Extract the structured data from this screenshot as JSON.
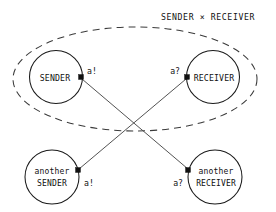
{
  "diagram": {
    "title": "SENDER × RECEIVER",
    "type": "process-composition-diagram",
    "canvas": {
      "width": 276,
      "height": 212,
      "background": "#ffffff"
    },
    "colors": {
      "stroke": "#1a1a1a",
      "dashed_group_stroke": "#3a3a3a",
      "line": "#4a4a4a",
      "port": "#111111",
      "text": "#111111"
    },
    "group": {
      "label": "SENDER × RECEIVER",
      "style": "dashed-ellipse",
      "members": [
        "SENDER",
        "RECEIVER"
      ],
      "cx": 135,
      "cy": 79,
      "rx": 122,
      "ry": 52
    },
    "nodes": [
      {
        "id": "sender",
        "line1": "SENDER",
        "line2": "",
        "cx": 56,
        "cy": 77,
        "r": 26.5,
        "in_group": true
      },
      {
        "id": "receiver",
        "line1": "RECEIVER",
        "line2": "",
        "cx": 213,
        "cy": 77,
        "r": 26.5,
        "in_group": true
      },
      {
        "id": "another-sender",
        "line1": "another",
        "line2": "SENDER",
        "cx": 52,
        "cy": 177,
        "r": 27,
        "in_group": false
      },
      {
        "id": "another-receiver",
        "line1": "another",
        "line2": "RECEIVER",
        "cx": 215,
        "cy": 177,
        "r": 27,
        "in_group": false
      }
    ],
    "ports": [
      {
        "id": "port-sender",
        "node": "sender",
        "label": "a!",
        "x": 81,
        "y": 77,
        "label_x": 87,
        "label_y": 71
      },
      {
        "id": "port-receiver",
        "node": "receiver",
        "label": "a?",
        "x": 187,
        "y": 77,
        "label_x": 168,
        "label_y": 71
      },
      {
        "id": "port-another-sender",
        "node": "another-sender",
        "label": "a!",
        "x": 78,
        "y": 170,
        "label_x": 84,
        "label_y": 182
      },
      {
        "id": "port-another-receiver",
        "node": "another-receiver",
        "label": "a?",
        "x": 189,
        "y": 170,
        "label_x": 172,
        "label_y": 182
      }
    ],
    "connections": [
      {
        "id": "sender-to-another-receiver",
        "from": "port-sender",
        "to": "port-another-receiver",
        "x1": 82,
        "y1": 79,
        "x2": 188,
        "y2": 169
      },
      {
        "id": "another-sender-to-receiver",
        "from": "port-another-sender",
        "to": "port-receiver",
        "x1": 79,
        "y1": 169,
        "x2": 186,
        "y2": 79
      }
    ]
  }
}
